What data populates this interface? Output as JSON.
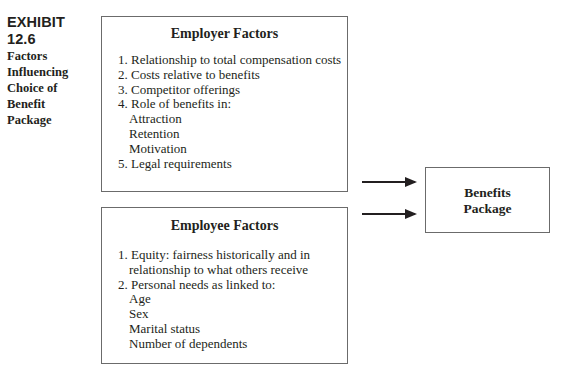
{
  "exhibit": {
    "number": "EXHIBIT 12.6",
    "title_lines": [
      "Factors",
      "Influencing",
      "Choice of",
      "Benefit",
      "Package"
    ]
  },
  "employer_box": {
    "title": "Employer Factors",
    "items": [
      "1. Relationship to total compensation costs",
      "2. Costs relative to benefits",
      "3. Competitor offerings",
      "4. Role of benefits in:",
      "Attraction",
      "Retention",
      "Motivation",
      "5. Legal requirements"
    ]
  },
  "employee_box": {
    "title": "Employee Factors",
    "items": [
      "1. Equity: fairness historically and in",
      "relationship to what others receive",
      "2. Personal needs as linked to:",
      "Age",
      "Sex",
      "Marital status",
      "Number of dependents"
    ]
  },
  "outcome_box": {
    "lines": [
      "Benefits",
      "Package"
    ]
  },
  "arrows": [
    {
      "from": "employer_box",
      "to": "outcome_box"
    },
    {
      "from": "employee_box",
      "to": "outcome_box"
    }
  ]
}
